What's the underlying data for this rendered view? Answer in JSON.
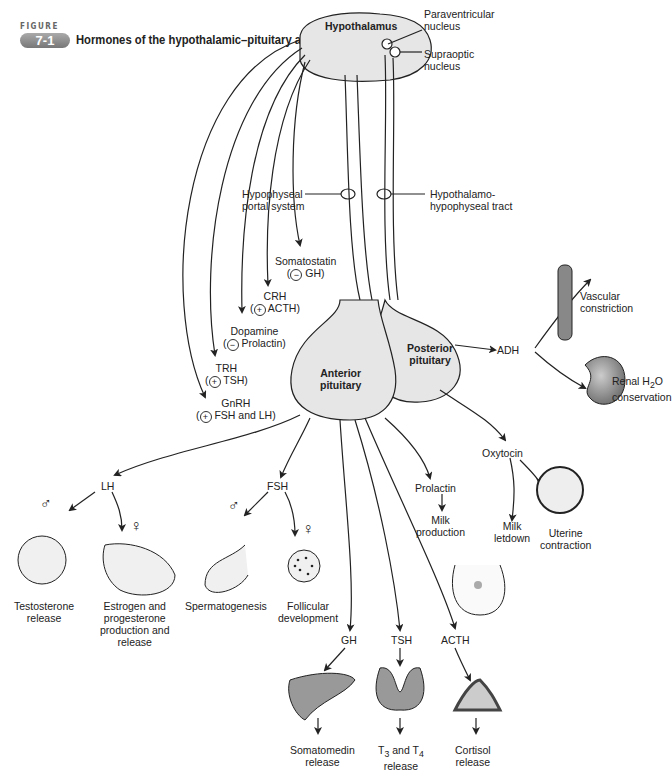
{
  "figure": {
    "label": "FIGURE",
    "number": "7-1",
    "title": "Hormones of the hypothalamic–pituitary axis"
  },
  "structures": {
    "hypothalamus": "Hypothalamus",
    "paraventricular": [
      "Paraventricular",
      "nucleus"
    ],
    "supraoptic": [
      "Supraoptic",
      "nucleus"
    ],
    "portal_system": [
      "Hypophyseal",
      "portal system"
    ],
    "tract": [
      "Hypothalamo-",
      "hypophyseal tract"
    ],
    "anterior_pituitary": [
      "Anterior",
      "pituitary"
    ],
    "posterior_pituitary": [
      "Posterior",
      "pituitary"
    ]
  },
  "releasing_hormones": [
    {
      "name": "Somatostatin",
      "effect_sign": "−",
      "target": "GH)"
    },
    {
      "name": "CRH",
      "effect_sign": "+",
      "target": "ACTH)"
    },
    {
      "name": "Dopamine",
      "effect_sign": "−",
      "target": "Prolactin)"
    },
    {
      "name": "TRH",
      "effect_sign": "+",
      "target": "TSH)"
    },
    {
      "name": "GnRH",
      "effect_sign": "+",
      "target": "FSH and LH)"
    }
  ],
  "posterior_outputs": {
    "adh": "ADH",
    "vascular": [
      "Vascular",
      "constriction"
    ],
    "renal": [
      "Renal H",
      "2",
      "O",
      "conservation"
    ],
    "oxytocin": "Oxytocin",
    "milk_letdown": [
      "Milk",
      "letdown"
    ],
    "uterine": [
      "Uterine",
      "contraction"
    ]
  },
  "anterior_outputs": {
    "lh": "LH",
    "fsh": "FSH",
    "prolactin": "Prolactin",
    "milk_production": [
      "Milk",
      "production"
    ],
    "testosterone": [
      "Testosterone",
      "release"
    ],
    "estrogen": [
      "Estrogen and",
      "progesterone",
      "production and",
      "release"
    ],
    "spermatogenesis": "Spermatogenesis",
    "follicular": [
      "Follicular",
      "development"
    ],
    "gh": "GH",
    "tsh": "TSH",
    "acth": "ACTH",
    "somatomedin": [
      "Somatomedin",
      "release"
    ],
    "t3t4": [
      "T",
      "3",
      " and T",
      "4",
      "release"
    ],
    "cortisol": [
      "Cortisol",
      "release"
    ]
  },
  "symbols": {
    "male": "♂",
    "female": "♀"
  },
  "colors": {
    "gland_fill": "#e6e6e6",
    "organ_fill": "#9a9a9a",
    "line": "#222222"
  }
}
